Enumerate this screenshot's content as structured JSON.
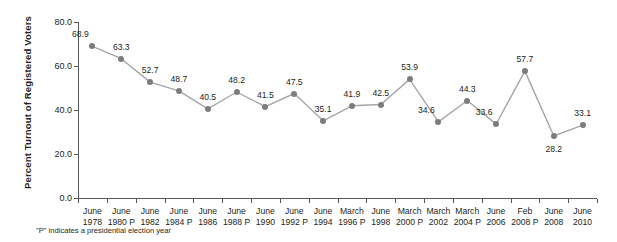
{
  "chart_data": {
    "type": "line",
    "title": "",
    "xlabel": "",
    "ylabel": "Percent Turnout of Registered Voters",
    "ylim": [
      0.0,
      80.0
    ],
    "ytick_labels": [
      "0.0",
      "20.0",
      "40.0",
      "60.0",
      "80.0"
    ],
    "ytick_values": [
      0.0,
      20.0,
      40.0,
      60.0,
      80.0
    ],
    "grid": false,
    "legend": "none",
    "categories": [
      "June 1978",
      "June 1980 P",
      "June 1982",
      "June 1984 P",
      "June 1986",
      "June 1988 P",
      "June 1990",
      "June 1992 P",
      "June 1994",
      "March 1996 P",
      "June 1998",
      "March 2000 P",
      "March 2002",
      "March 2004 P",
      "June 2006",
      "Feb 2008 P",
      "June 2008",
      "June 2010"
    ],
    "category_lines": [
      [
        "June",
        "1978"
      ],
      [
        "June",
        "1980 P"
      ],
      [
        "June",
        "1982"
      ],
      [
        "June",
        "1984 P"
      ],
      [
        "June",
        "1986"
      ],
      [
        "June",
        "1988 P"
      ],
      [
        "June",
        "1990"
      ],
      [
        "June",
        "1992 P"
      ],
      [
        "June",
        "1994"
      ],
      [
        "March",
        "1996 P"
      ],
      [
        "June",
        "1998"
      ],
      [
        "March",
        "2000 P"
      ],
      [
        "March",
        "2002"
      ],
      [
        "March",
        "2004 P"
      ],
      [
        "June",
        "2006"
      ],
      [
        "Feb",
        "2008 P"
      ],
      [
        "June",
        "2008"
      ],
      [
        "June",
        "2010"
      ]
    ],
    "values": [
      68.9,
      63.3,
      52.7,
      48.7,
      40.5,
      48.2,
      41.5,
      47.5,
      35.1,
      41.9,
      42.5,
      53.9,
      34.6,
      44.3,
      33.6,
      57.7,
      28.2,
      33.1
    ],
    "value_labels": [
      "68.9",
      "63.3",
      "52.7",
      "48.7",
      "40.5",
      "48.2",
      "41.5",
      "47.5",
      "35.1",
      "41.9",
      "42.5",
      "53.9",
      "34.6",
      "44.3",
      "33.6",
      "57.7",
      "28.2",
      "33.1"
    ],
    "label_placement": [
      "above-left",
      "above",
      "above",
      "above",
      "above",
      "above",
      "above",
      "above",
      "above",
      "above",
      "above",
      "above",
      "above-left",
      "above",
      "above-left",
      "above",
      "below",
      "above"
    ],
    "series_color": "#7c7c7e",
    "line_color": "#a6a6a8",
    "axis_color": "#58595b",
    "text_color": "#231f20",
    "background": "#ffffff"
  },
  "footnote": {
    "text": "\"P\" indicates a presidential election year"
  }
}
